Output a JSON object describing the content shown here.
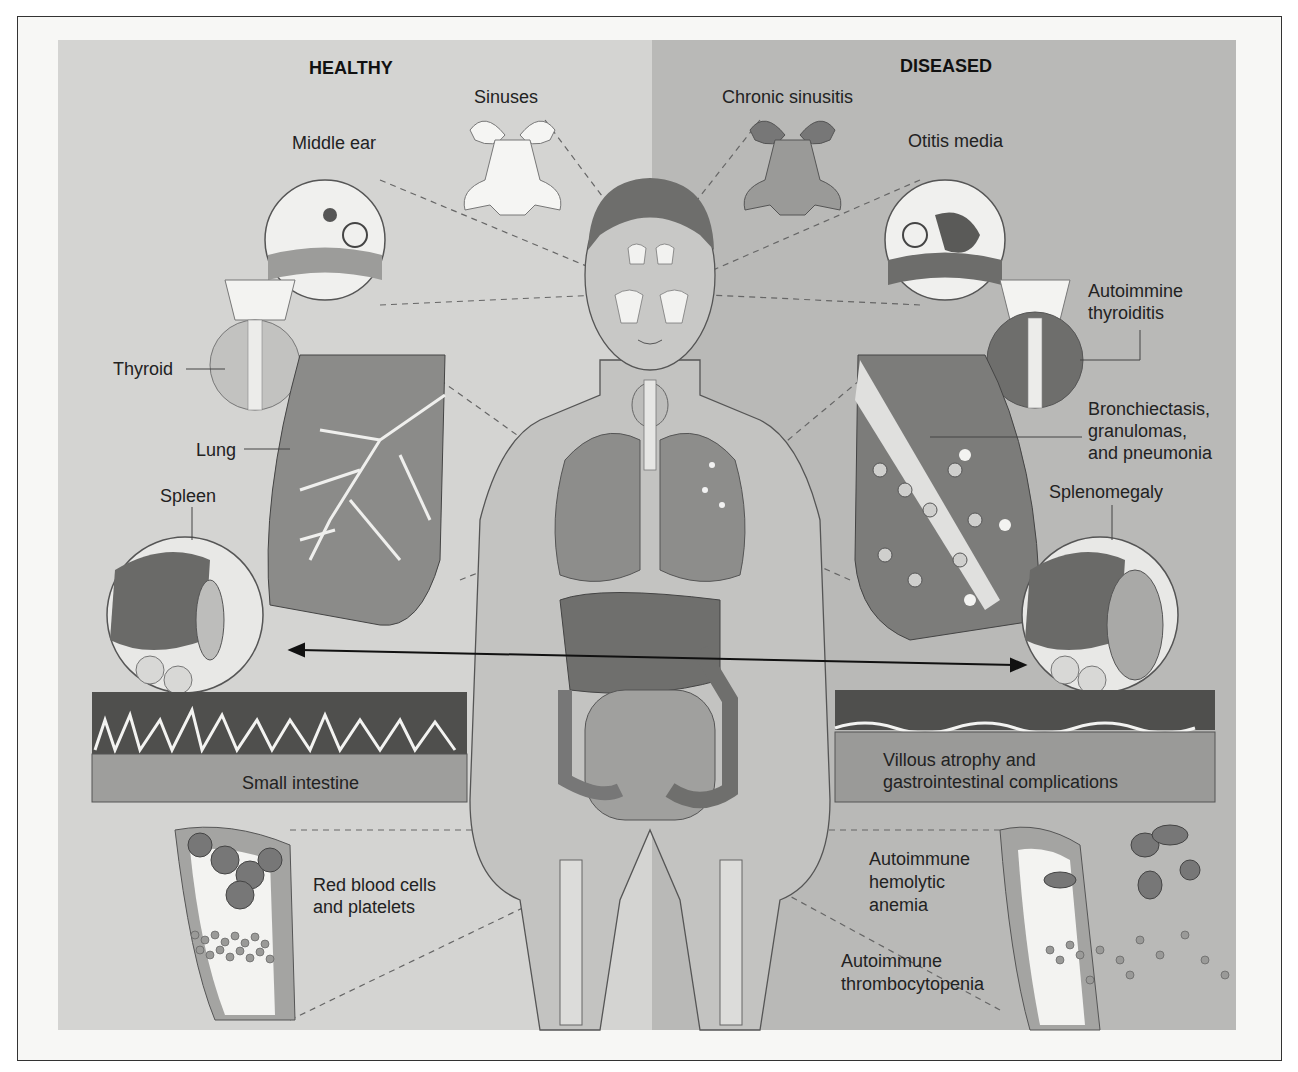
{
  "headings": {
    "healthy": "HEALTHY",
    "diseased": "DISEASED"
  },
  "healthy_labels": {
    "sinuses": "Sinuses",
    "middle_ear": "Middle ear",
    "thyroid": "Thyroid",
    "lung": "Lung",
    "spleen": "Spleen",
    "small_intestine": "Small intestine",
    "blood_line1": "Red blood cells",
    "blood_line2": "and platelets"
  },
  "diseased_labels": {
    "sinusitis": "Chronic sinusitis",
    "otitis": "Otitis media",
    "thyroiditis_line1": "Autoimmine",
    "thyroiditis_line2": "thyroiditis",
    "lung_line1": "Bronchiectasis,",
    "lung_line2": "granulomas,",
    "lung_line3": "and pneumonia",
    "splenomegaly": "Splenomegaly",
    "gi_line1": "Villous atrophy and",
    "gi_line2": "gastrointestinal complications",
    "anemia_line1": "Autoimmune",
    "anemia_line2": "hemolytic",
    "anemia_line3": "anemia",
    "thrombo_line1": "Autoimmune",
    "thrombo_line2": "thrombocytopenia"
  },
  "colors": {
    "healthy_bg": "#d4d4d2",
    "diseased_bg": "#b9b9b7",
    "organ_dark": "#8a8a88",
    "organ_mid": "#a6a6a4",
    "body_light": "#c8c8c6"
  }
}
